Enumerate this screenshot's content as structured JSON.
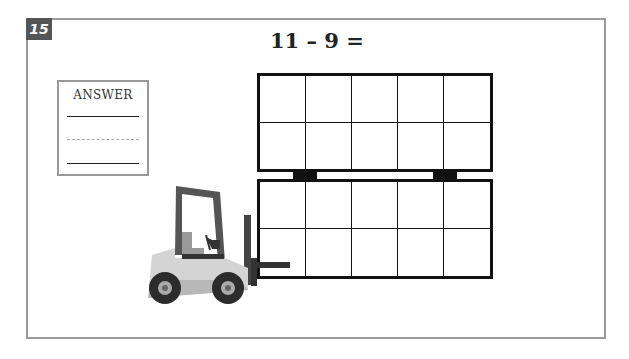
{
  "problem": {
    "number": "15",
    "equation": "11 – 9 =",
    "answer_label": "ANSWER"
  },
  "illustration": {
    "ten_frames": [
      {
        "rows": 2,
        "cols": 5,
        "filled": 0
      },
      {
        "rows": 2,
        "cols": 5,
        "filled": 0
      }
    ],
    "vehicle": "forklift-icon"
  },
  "colors": {
    "frame_border": "#9a9a9a",
    "badge_bg": "#555555",
    "grid_line": "#111111"
  }
}
